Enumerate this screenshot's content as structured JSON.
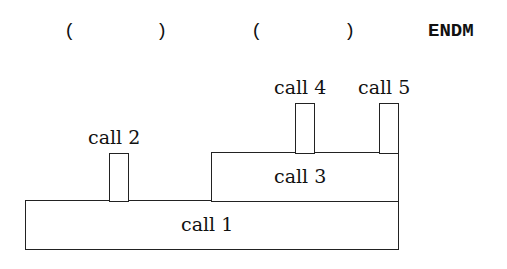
{
  "header": {
    "paren_open_1": "(",
    "paren_close_1": ")",
    "paren_open_2": "(",
    "paren_close_2": ")",
    "endm": "ENDM"
  },
  "calls": [
    {
      "label": "call 1"
    },
    {
      "label": "call 2"
    },
    {
      "label": "call 3"
    },
    {
      "label": "call 4"
    },
    {
      "label": "call 5"
    }
  ]
}
